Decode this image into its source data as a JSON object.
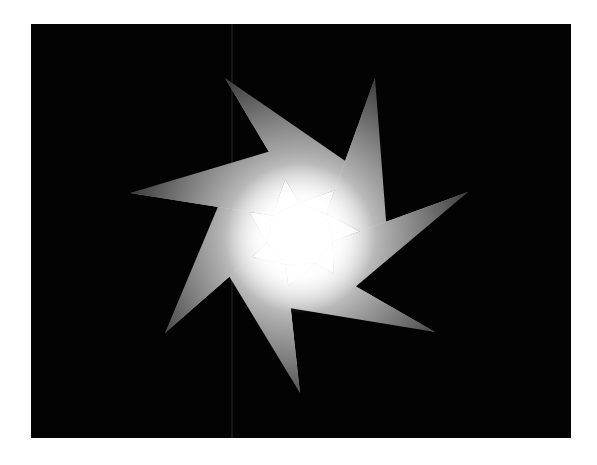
{
  "figure": {
    "description": "Seven-pointed pinwheel star with radial gradient shading on black background",
    "canvas": {
      "width": 597,
      "height": 465,
      "background": "#ffffff"
    },
    "panel": {
      "x": 31,
      "y": 24,
      "width": 540,
      "height": 414,
      "color": "#030303"
    },
    "artifact_line": {
      "x": 232,
      "color": "#2a2a2a"
    },
    "star": {
      "points": 7,
      "center": [
        300,
        238
      ],
      "tips": [
        [
          225,
          78
        ],
        [
          375,
          78
        ],
        [
          468,
          192
        ],
        [
          435,
          332
        ],
        [
          300,
          393
        ],
        [
          165,
          333
        ],
        [
          130,
          193
        ]
      ],
      "notches": [
        [
          298,
          143
        ],
        [
          370,
          178
        ],
        [
          388,
          246
        ],
        [
          335,
          304
        ],
        [
          265,
          304
        ],
        [
          212,
          248
        ],
        [
          230,
          178
        ]
      ],
      "colors": {
        "center": "#ffffff",
        "mid": "#c8c8c8",
        "tip_light": "#8a8a8a",
        "tip_dark": "#4e4e4e"
      }
    }
  }
}
